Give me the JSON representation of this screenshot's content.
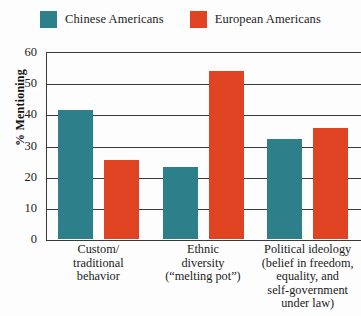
{
  "legend": {
    "entries": [
      {
        "label": "Chinese Americans",
        "color": "#2D8089",
        "swatch_name": "legend-swatch-chinese-americans"
      },
      {
        "label": "European Americans",
        "color": "#DF4322",
        "swatch_name": "legend-swatch-european-americans"
      }
    ]
  },
  "axis": {
    "y_title": "% Mentioning",
    "y_ticks": [
      "0",
      "10",
      "20",
      "30",
      "40",
      "50",
      "60"
    ]
  },
  "chart_data": {
    "type": "bar",
    "title": "",
    "xlabel": "",
    "ylabel": "% Mentioning",
    "ylim": [
      0,
      60
    ],
    "ytick_step": 10,
    "grid": true,
    "legend_position": "top-center",
    "categories": [
      "Custom/\ntraditional\nbehavior",
      "Ethnic\ndiversity\n(“melting pot”)",
      "Political ideology\n(belief in freedom,\nequality, and\nself-government\nunder law)"
    ],
    "category_lines": [
      [
        "Custom/",
        "traditional",
        "behavior"
      ],
      [
        "Ethnic",
        "diversity",
        "(“melting pot”)"
      ],
      [
        "Political ideology",
        "(belief in freedom,",
        "equality, and",
        "self-government",
        "under law)"
      ]
    ],
    "series": [
      {
        "name": "Chinese Americans",
        "color": "#2D8089",
        "values": [
          41.5,
          23,
          32
        ]
      },
      {
        "name": "European Americans",
        "color": "#DF4322",
        "values": [
          25.5,
          54,
          35.5
        ]
      }
    ]
  }
}
